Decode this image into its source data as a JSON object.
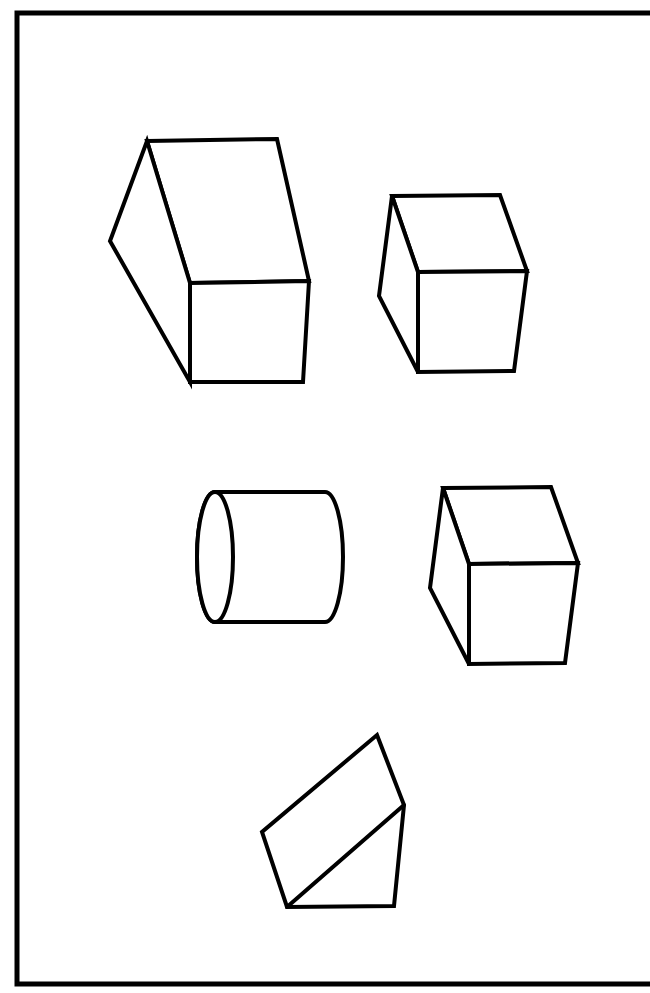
{
  "page": {
    "width": 650,
    "height": 993,
    "background_color": "#ffffff",
    "ink_color": "#000000",
    "title_margin_text": "ABC"
  },
  "frame": {
    "name": "worksheet-border",
    "stroke_color": "#000000",
    "stroke_width": 5,
    "left": 16,
    "top": 12,
    "right": 650,
    "bottom": 985
  },
  "figures": [
    {
      "id": "figure-1",
      "name": "rectangular-prism",
      "label": "Rectangular prism",
      "stroke_color": "#000000",
      "stroke_width": 4,
      "fill": "#ffffff",
      "vertices": {
        "top_front_left": [
          147,
          141
        ],
        "top_front_right": [
          277,
          139
        ],
        "top_back_right": [
          309,
          281
        ],
        "top_back_left": [
          190,
          283
        ],
        "bottom_back_left": [
          190,
          382
        ],
        "bottom_back_right": [
          303,
          382
        ],
        "side_bottom_left": [
          110,
          241
        ]
      }
    },
    {
      "id": "figure-2",
      "name": "cube-upper-right",
      "label": "Cube",
      "stroke_color": "#000000",
      "stroke_width": 4,
      "fill": "#ffffff",
      "vertices": {
        "top_front_left": [
          392,
          196
        ],
        "top_front_right": [
          500,
          195
        ],
        "top_back_right": [
          527,
          271
        ],
        "top_back_left": [
          418,
          272
        ],
        "bottom_back_left": [
          418,
          372
        ],
        "bottom_back_right": [
          514,
          371
        ],
        "side_bottom_left": [
          379,
          296
        ]
      }
    },
    {
      "id": "figure-3",
      "name": "cylinder",
      "label": "Cylinder",
      "stroke_color": "#000000",
      "stroke_width": 4,
      "fill": "#ffffff",
      "geometry": {
        "left_ellipse_center": [
          215,
          557
        ],
        "left_ellipse_rx": 18,
        "left_ellipse_ry": 65,
        "right_arc_center": [
          325,
          557
        ],
        "right_arc_rx": 18,
        "right_arc_ry": 65,
        "top_y": 492,
        "bottom_y": 622
      }
    },
    {
      "id": "figure-4",
      "name": "cube-lower-right",
      "label": "Cube",
      "stroke_color": "#000000",
      "stroke_width": 4,
      "fill": "#ffffff",
      "vertices": {
        "top_front_left": [
          443,
          488
        ],
        "top_front_right": [
          551,
          487
        ],
        "top_back_right": [
          578,
          563
        ],
        "top_back_left": [
          469,
          564
        ],
        "bottom_back_left": [
          469,
          664
        ],
        "bottom_back_right": [
          565,
          663
        ],
        "side_bottom_left": [
          430,
          588
        ]
      }
    },
    {
      "id": "figure-5",
      "name": "triangular-prism-wedge",
      "label": "Triangular prism",
      "stroke_color": "#000000",
      "stroke_width": 4,
      "fill": "#ffffff",
      "vertices": {
        "apex_top": [
          377,
          735
        ],
        "right_mid": [
          404,
          805
        ],
        "bottom_right": [
          394,
          906
        ],
        "bottom_left": [
          287,
          907
        ],
        "left_mid": [
          262,
          832
        ]
      }
    }
  ]
}
